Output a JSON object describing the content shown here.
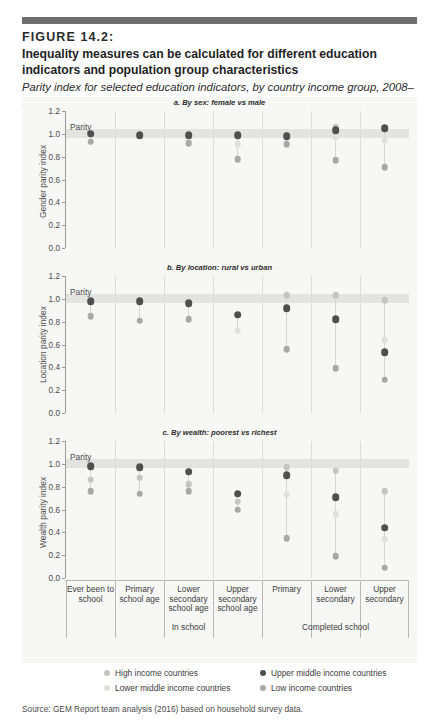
{
  "figure": {
    "label": "FIGURE 14.2:",
    "title": "Inequality measures can be calculated for different education indicators and population group characteristics",
    "subtitle": "Parity index for selected education indicators, by country income group, 2008–2014",
    "source": "Source: GEM Report team analysis (2016) based on household survey data."
  },
  "legend": {
    "position": "bottom",
    "items": [
      {
        "label": "High income countries",
        "color": "#c4c4c0"
      },
      {
        "label": "Upper middle income countries",
        "color": "#4f4f4f"
      },
      {
        "label": "Lower middle income countries",
        "color": "#e0e0dc"
      },
      {
        "label": "Low income countries",
        "color": "#a8a8a4"
      }
    ]
  },
  "xaxis": {
    "categories": [
      "Ever been to school",
      "Primary school age",
      "Lower secondary school age",
      "Upper secondary school age",
      "Primary",
      "Lower secondary",
      "Upper secondary"
    ],
    "groups": [
      {
        "label": "In school",
        "from": 1,
        "to": 3
      },
      {
        "label": "Completed school",
        "from": 4,
        "to": 6
      }
    ]
  },
  "parity": {
    "label": "Parity",
    "value": 1.0
  },
  "chart_data": [
    {
      "type": "scatter",
      "title": "a. By sex: female vs male",
      "ylabel": "Gender parity index",
      "xlabel": "",
      "ylim": [
        0.0,
        1.2
      ],
      "yticks": [
        0.0,
        0.2,
        0.4,
        0.6,
        0.8,
        1.0,
        1.2
      ],
      "grid": false,
      "categories": [
        "Ever been to school",
        "Primary school age",
        "Lower secondary school age",
        "Upper secondary school age",
        "Primary",
        "Lower secondary",
        "Upper secondary"
      ],
      "series": [
        {
          "name": "High income countries",
          "values": [
            null,
            null,
            null,
            null,
            0.99,
            1.06,
            null
          ]
        },
        {
          "name": "Upper middle income countries",
          "values": [
            1.0,
            0.99,
            0.99,
            0.99,
            0.98,
            1.03,
            1.05
          ]
        },
        {
          "name": "Lower middle income countries",
          "values": [
            null,
            null,
            null,
            0.91,
            null,
            0.97,
            0.94
          ]
        },
        {
          "name": "Low income countries",
          "values": [
            0.93,
            null,
            0.92,
            0.78,
            0.91,
            0.77,
            0.71
          ]
        }
      ]
    },
    {
      "type": "scatter",
      "title": "b. By location: rural vs urban",
      "ylabel": "Location parity index",
      "xlabel": "",
      "ylim": [
        0.0,
        1.2
      ],
      "yticks": [
        0.0,
        0.2,
        0.4,
        0.6,
        0.8,
        1.0,
        1.2
      ],
      "grid": false,
      "categories": [
        "Ever been to school",
        "Primary school age",
        "Lower secondary school age",
        "Upper secondary school age",
        "Primary",
        "Lower secondary",
        "Upper secondary"
      ],
      "series": [
        {
          "name": "High income countries",
          "values": [
            null,
            null,
            null,
            null,
            1.03,
            1.03,
            0.99
          ]
        },
        {
          "name": "Upper middle income countries",
          "values": [
            0.98,
            0.98,
            0.96,
            0.86,
            0.92,
            0.82,
            0.53
          ]
        },
        {
          "name": "Lower middle income countries",
          "values": [
            null,
            null,
            null,
            0.72,
            null,
            null,
            0.64
          ]
        },
        {
          "name": "Low income countries",
          "values": [
            0.85,
            0.81,
            0.82,
            null,
            0.56,
            0.39,
            0.29
          ]
        }
      ]
    },
    {
      "type": "scatter",
      "title": "c. By wealth: poorest vs richest",
      "ylabel": "Wealth parity index",
      "xlabel": "",
      "ylim": [
        0.0,
        1.2
      ],
      "yticks": [
        0.0,
        0.2,
        0.4,
        0.6,
        0.8,
        1.0,
        1.2
      ],
      "grid": false,
      "categories": [
        "Ever been to school",
        "Primary school age",
        "Lower secondary school age",
        "Upper secondary school age",
        "Primary",
        "Lower secondary",
        "Upper secondary"
      ],
      "series": [
        {
          "name": "High income countries",
          "values": [
            0.86,
            0.88,
            0.82,
            0.67,
            0.97,
            0.94,
            0.76
          ]
        },
        {
          "name": "Upper middle income countries",
          "values": [
            0.98,
            0.97,
            0.93,
            0.74,
            0.9,
            0.71,
            0.44
          ]
        },
        {
          "name": "Lower middle income countries",
          "values": [
            null,
            null,
            null,
            null,
            0.73,
            0.56,
            0.34
          ]
        },
        {
          "name": "Low income countries",
          "values": [
            0.76,
            0.74,
            0.76,
            0.6,
            0.35,
            0.19,
            0.09
          ]
        }
      ]
    }
  ]
}
